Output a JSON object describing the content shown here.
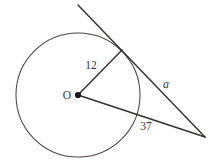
{
  "figure": {
    "kind": "circle-tangent-secant-geometry-diagram",
    "background_color": "#ffffff",
    "stroke_color": "#35302f",
    "circle_stroke_color": "#4a4443",
    "label_color": "#3b3635"
  },
  "labels": {
    "center": "O",
    "radius": "12",
    "tangent_segment": "a",
    "secant_segment": "37"
  },
  "geometry": {
    "circle": {
      "cx": 78,
      "cy": 95,
      "r": 62
    },
    "center_point": {
      "x": 78,
      "y": 95
    },
    "tangent_point": {
      "x": 122,
      "y": 50
    },
    "external_point": {
      "x": 205,
      "y": 137
    },
    "tangent_ray_start": {
      "x": 78,
      "y": 5
    },
    "secant_circle_crossing": {
      "x": 137,
      "y": 122
    },
    "label_positions": {
      "center": {
        "x": 67,
        "y": 96
      },
      "radius": {
        "x": 91,
        "y": 66
      },
      "tangent_segment": {
        "x": 166,
        "y": 85
      },
      "secant_segment": {
        "x": 146,
        "y": 127
      }
    }
  }
}
